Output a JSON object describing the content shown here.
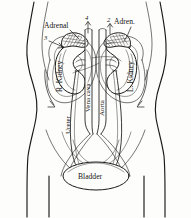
{
  "figure": {
    "type": "anatomical-line-drawing",
    "background_color": "#fdfdfb",
    "ink_color": "#1a1a18",
    "view": "anterior abdominal view"
  },
  "labels": {
    "adrenal_left": "Adrenal",
    "adrenal_right": "Adren.",
    "kidney_right": "R. Kidney",
    "kidney_left": "L. Kidney",
    "vena_cava": "Vena cava",
    "aorta": "Aorta",
    "ureter": "Ureter",
    "bladder": "Bladder"
  },
  "markers": [
    {
      "number": "3",
      "position": "upper-left"
    },
    {
      "number": "4",
      "position": "top-center"
    },
    {
      "number": "2",
      "position": "top-center-right"
    }
  ],
  "structures": [
    "abdominal body outline",
    "right kidney",
    "left kidney",
    "right adrenal gland",
    "left adrenal gland",
    "inferior vena cava",
    "abdominal aorta",
    "right ureter",
    "left ureter",
    "urinary bladder",
    "common iliac vessels"
  ]
}
